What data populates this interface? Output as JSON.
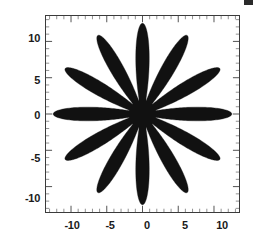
{
  "figure": {
    "background_color": "#ffffff",
    "ink_color": "#111111",
    "frame_color": "#3b3b3b"
  },
  "axes": {
    "x_tick_labels": [
      "-10",
      "-5",
      "0",
      "5",
      "10"
    ],
    "y_tick_labels": [
      "10",
      "5",
      "0",
      "-5",
      "-10"
    ]
  },
  "chart_data": {
    "type": "line",
    "title": "",
    "subtitle": "",
    "xlabel": "",
    "ylabel": "",
    "plot_style": "polar-filled",
    "fill": true,
    "fill_color": "#111111",
    "grid": false,
    "legend": null,
    "legend_position": "none",
    "xlim": [
      -13.5,
      13.5
    ],
    "ylim": [
      -13.5,
      13.5
    ],
    "x_ticks": [
      -10,
      -5,
      0,
      5,
      10
    ],
    "y_ticks": [
      -10,
      -5,
      0,
      5,
      10
    ],
    "minor_ticks": true,
    "aspect": "equal",
    "polar_equation": "r(theta) = 7.2 + 5.3*cos(12*theta)",
    "n_points": 12,
    "r_max": 12.5,
    "r_min": 1.9,
    "series": [
      {
        "name": "r = 7.2 + 5.3 cos(12 theta)",
        "r_values": [
          12.5,
          11.4,
          8.7,
          5.6,
          3.2,
          2.1,
          1.9,
          2.1,
          3.2,
          5.6,
          8.7,
          11.4,
          12.5,
          11.4,
          8.7,
          5.6,
          3.2,
          2.1,
          1.9,
          2.1,
          3.2,
          5.6,
          8.7,
          11.4,
          12.5,
          11.4,
          8.7,
          5.6,
          3.2,
          2.1,
          1.9,
          2.1,
          3.2,
          5.6,
          8.7,
          11.4,
          12.5,
          11.4,
          8.7,
          5.6,
          3.2,
          2.1,
          1.9,
          2.1,
          3.2,
          5.6,
          8.7,
          11.4
        ],
        "theta_degrees": [
          0,
          7.5,
          15,
          22.5,
          30,
          37.5,
          45,
          52.5,
          60,
          67.5,
          75,
          82.5,
          90,
          97.5,
          105,
          112.5,
          120,
          127.5,
          135,
          142.5,
          150,
          157.5,
          165,
          172.5,
          180,
          187.5,
          195,
          202.5,
          210,
          217.5,
          225,
          232.5,
          240,
          247.5,
          255,
          262.5,
          270,
          277.5,
          285,
          292.5,
          300,
          307.5,
          315,
          322.5,
          330,
          337.5,
          345,
          352.5
        ]
      }
    ],
    "spike_tip_angles_degrees": [
      15,
      45,
      75,
      105,
      135,
      165,
      195,
      225,
      255,
      285,
      315,
      345
    ],
    "spike_tip_radius": 12.5,
    "valley_angles_degrees": [
      0,
      30,
      60,
      90,
      120,
      150,
      180,
      210,
      240,
      270,
      300,
      330
    ],
    "valley_radius": 1.9
  }
}
